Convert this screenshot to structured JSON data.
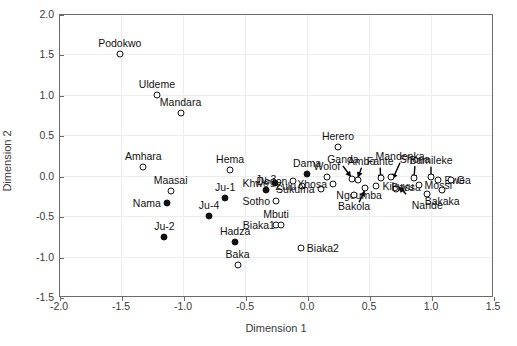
{
  "chart_data": {
    "type": "scatter",
    "title": "",
    "xlabel": "Dimension 1",
    "ylabel": "Dimension 2",
    "xlim": [
      -2.0,
      1.5
    ],
    "ylim": [
      -1.5,
      2.0
    ],
    "xticks": [
      "-2.0",
      "-1.5",
      "-1.0",
      "-0.5",
      "0.0",
      "0.5",
      "1.0",
      "1.5"
    ],
    "yticks": [
      "-1.5",
      "-1.0",
      "-0.5",
      "0.0",
      "0.5",
      "1.0",
      "1.5",
      "2.0"
    ],
    "xtick_values": [
      -2.0,
      -1.5,
      -1.0,
      -0.5,
      0.0,
      0.5,
      1.0,
      1.5
    ],
    "ytick_values": [
      -1.5,
      -1.0,
      -0.5,
      0.0,
      0.5,
      1.0,
      1.5,
      2.0
    ],
    "grid": true,
    "legend": "none",
    "marker_styles": {
      "open": "open circle (hollow, black outline)",
      "filled": "filled black circle"
    },
    "points": [
      {
        "label": "Podokwo",
        "x": -1.51,
        "y": 1.51,
        "marker": "open",
        "lpos": "above"
      },
      {
        "label": "Uldeme",
        "x": -1.21,
        "y": 1.0,
        "marker": "open",
        "lpos": "above"
      },
      {
        "label": "Mandara",
        "x": -1.02,
        "y": 0.77,
        "marker": "open",
        "lpos": "above"
      },
      {
        "label": "Amhara",
        "x": -1.32,
        "y": 0.11,
        "marker": "open",
        "lpos": "above"
      },
      {
        "label": "Maasai",
        "x": -1.1,
        "y": -0.19,
        "marker": "open",
        "lpos": "above"
      },
      {
        "label": "Nama",
        "x": -1.13,
        "y": -0.34,
        "marker": "filled",
        "lpos": "left"
      },
      {
        "label": "Ju-2",
        "x": -1.15,
        "y": -0.76,
        "marker": "filled",
        "lpos": "above"
      },
      {
        "label": "Hema",
        "x": -0.62,
        "y": 0.07,
        "marker": "open",
        "lpos": "above"
      },
      {
        "label": "Ju-1",
        "x": -0.66,
        "y": -0.27,
        "marker": "filled",
        "lpos": "above"
      },
      {
        "label": "Ju-4",
        "x": -0.79,
        "y": -0.5,
        "marker": "filled",
        "lpos": "above"
      },
      {
        "label": "Hadza",
        "x": -0.58,
        "y": -0.82,
        "marker": "filled",
        "lpos": "above"
      },
      {
        "label": "Baka",
        "x": -0.56,
        "y": -1.1,
        "marker": "open",
        "lpos": "above"
      },
      {
        "label": "Ju-3",
        "x": -0.33,
        "y": -0.18,
        "marker": "filled",
        "lpos": "above"
      },
      {
        "label": "Khwe",
        "x": -0.26,
        "y": -0.09,
        "marker": "filled",
        "lpos": "left"
      },
      {
        "label": "Sotho",
        "x": -0.25,
        "y": -0.31,
        "marker": "open",
        "lpos": "left"
      },
      {
        "label": "Mbuti",
        "x": -0.25,
        "y": -0.61,
        "marker": "open",
        "lpos": "above"
      },
      {
        "label": "Dogon",
        "x": -0.11,
        "y": -0.06,
        "marker": "open",
        "lpos": "left"
      },
      {
        "label": "Dama",
        "x": 0.0,
        "y": 0.02,
        "marker": "filled",
        "lpos": "above"
      },
      {
        "label": "Zulu",
        "x": -0.04,
        "y": -0.13,
        "marker": "open",
        "lpos": "left"
      },
      {
        "label": "Biaka2",
        "x": -0.05,
        "y": -0.9,
        "marker": "open",
        "lpos": "right"
      },
      {
        "label": "Biaka1",
        "x": -0.21,
        "y": -0.61,
        "marker": "open",
        "lpos": "left"
      },
      {
        "label": "Sukuma",
        "x": 0.11,
        "y": -0.17,
        "marker": "open",
        "lpos": "left"
      },
      {
        "label": "Wolof",
        "x": 0.16,
        "y": -0.01,
        "marker": "open",
        "lpos": "above"
      },
      {
        "label": "Xhosa",
        "x": 0.21,
        "y": -0.1,
        "marker": "open",
        "lpos": "left"
      },
      {
        "label": "Herero",
        "x": 0.25,
        "y": 0.36,
        "marker": "open",
        "lpos": "above"
      },
      {
        "label": "Ganda",
        "x": 0.36,
        "y": -0.04,
        "marker": "open",
        "lpos": "arrow"
      },
      {
        "label": "Ambo",
        "x": 0.41,
        "y": -0.05,
        "marker": "open",
        "lpos": "arrow"
      },
      {
        "label": "Ngoumba",
        "x": 0.47,
        "y": -0.15,
        "marker": "open",
        "lpos": "arrow"
      },
      {
        "label": "Bakola",
        "x": 0.38,
        "y": -0.24,
        "marker": "open",
        "lpos": "below"
      },
      {
        "label": "Kikuyu",
        "x": 0.56,
        "y": -0.13,
        "marker": "open",
        "lpos": "right"
      },
      {
        "label": "Fante",
        "x": 0.6,
        "y": -0.03,
        "marker": "open",
        "lpos": "arrow"
      },
      {
        "label": "Mandenka",
        "x": 0.68,
        "y": -0.02,
        "marker": "open",
        "lpos": "arrow"
      },
      {
        "label": "Bassa",
        "x": 0.72,
        "y": -0.16,
        "marker": "open",
        "lpos": "arrow"
      },
      {
        "label": "Shona",
        "x": 0.86,
        "y": -0.03,
        "marker": "open",
        "lpos": "arrow"
      },
      {
        "label": "Mossi",
        "x": 0.9,
        "y": -0.12,
        "marker": "open",
        "lpos": "right"
      },
      {
        "label": "Nande",
        "x": 0.97,
        "y": -0.22,
        "marker": "open",
        "lpos": "below"
      },
      {
        "label": "Bamileke",
        "x": 1.0,
        "y": -0.02,
        "marker": "open",
        "lpos": "arrow"
      },
      {
        "label": "Ewe",
        "x": 1.06,
        "y": -0.05,
        "marker": "open",
        "lpos": "right"
      },
      {
        "label": "Bakaka",
        "x": 1.09,
        "y": -0.18,
        "marker": "open",
        "lpos": "below"
      },
      {
        "label": "Ga",
        "x": 1.16,
        "y": -0.05,
        "marker": "open",
        "lpos": "right"
      }
    ],
    "arrow_annotations": [
      {
        "label": "Ganda",
        "from_x": 0.29,
        "from_y": 0.12,
        "to_x": 0.355,
        "to_y": -0.015
      },
      {
        "label": "Ambo",
        "from_x": 0.44,
        "from_y": 0.1,
        "to_x": 0.41,
        "to_y": -0.025
      },
      {
        "label": "Ngoumba",
        "from_x": 0.42,
        "from_y": -0.33,
        "to_x": 0.465,
        "to_y": -0.185
      },
      {
        "label": "Fante",
        "from_x": 0.59,
        "from_y": 0.1,
        "to_x": 0.595,
        "to_y": -0.055
      },
      {
        "label": "Mandenka",
        "from_x": 0.75,
        "from_y": 0.16,
        "to_x": 0.69,
        "to_y": -0.045
      },
      {
        "label": "Bassa",
        "from_x": 0.8,
        "from_y": -0.23,
        "to_x": 0.74,
        "to_y": -0.14
      },
      {
        "label": "Shona",
        "from_x": 0.87,
        "from_y": 0.12,
        "to_x": 0.862,
        "to_y": -0.055
      },
      {
        "label": "Bamileke",
        "from_x": 1.0,
        "from_y": 0.11,
        "to_x": 1.0,
        "to_y": -0.05
      }
    ]
  }
}
